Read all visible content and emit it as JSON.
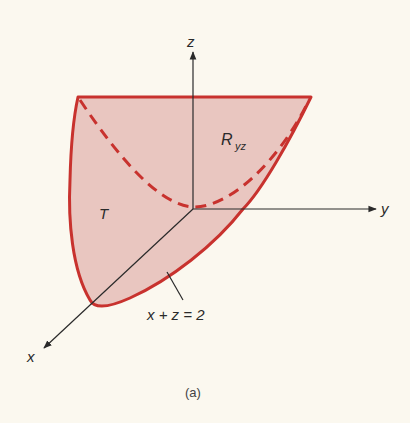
{
  "figure": {
    "caption": "(a)",
    "colors": {
      "background": "#fbf8ef",
      "region_fill": "#e9c6c0",
      "region_stroke": "#c8322e",
      "axis": "#2a2a2a"
    },
    "axes": {
      "x_label": "x",
      "y_label": "y",
      "z_label": "z"
    },
    "labels": {
      "solid": "T",
      "projection_main": "R",
      "projection_sub": "yz",
      "plane_equation": "x + z = 2"
    }
  }
}
